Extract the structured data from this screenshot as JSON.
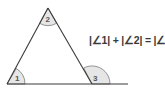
{
  "diagram": {
    "angles": [
      {
        "id": "1",
        "label": "1",
        "role": "interior angle at bottom-left vertex"
      },
      {
        "id": "2",
        "label": "2",
        "role": "interior angle at apex"
      },
      {
        "id": "3",
        "label": "3",
        "role": "exterior angle at bottom-right vertex"
      }
    ],
    "formula": "|∠1| + |∠2| = |∠3|",
    "colors": {
      "line": "#3a3a3a",
      "arc_fill": "#e6e6e6",
      "arc_stroke": "#7a7a7a",
      "text": "#3a3a3a"
    }
  }
}
